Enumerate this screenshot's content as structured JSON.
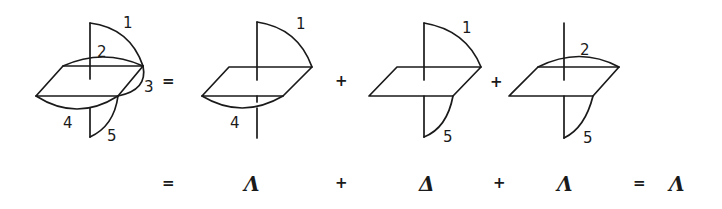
{
  "diagram": {
    "top_row": {
      "figures": [
        {
          "name": "full",
          "labels": [
            "1",
            "2",
            "3",
            "4",
            "5"
          ]
        },
        {
          "name": "term-1-4",
          "labels": [
            "1",
            "4"
          ]
        },
        {
          "name": "term-1-5",
          "labels": [
            "1",
            "5"
          ]
        },
        {
          "name": "term-2-5",
          "labels": [
            "2",
            "5"
          ]
        }
      ],
      "operators": [
        "=",
        "+",
        "+"
      ]
    },
    "bottom_row": {
      "items": [
        "=",
        "Λ",
        "+",
        "Δ",
        "+",
        "Λ",
        "=",
        "Λ"
      ]
    }
  }
}
